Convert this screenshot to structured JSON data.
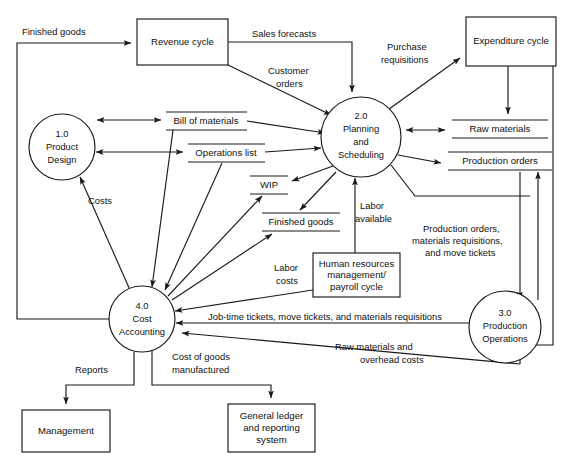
{
  "diagram": {
    "accent_color": "#1a1a1a",
    "background_color": "#ffffff"
  },
  "processes": [
    {
      "id": "p1",
      "number": "1.0",
      "line1": "Product",
      "line2": "Design",
      "cx": 62,
      "cy": 147,
      "r": 33
    },
    {
      "id": "p2",
      "number": "2.0",
      "line1": "Planning",
      "line2": "and",
      "line3": "Scheduling",
      "cx": 361,
      "cy": 137,
      "r": 40
    },
    {
      "id": "p3",
      "number": "3.0",
      "line1": "Production",
      "line2": "Operations",
      "cx": 505,
      "cy": 327,
      "r": 36
    },
    {
      "id": "p4",
      "number": "4.0",
      "line1": "Cost",
      "line2": "Accounting",
      "cx": 142,
      "cy": 319,
      "r": 33
    }
  ],
  "entities": [
    {
      "id": "e-revenue",
      "line1": "Revenue cycle",
      "x": 137,
      "y": 19,
      "w": 91,
      "h": 46
    },
    {
      "id": "e-expenditure",
      "line1": "Expenditure cycle",
      "x": 466,
      "y": 17,
      "w": 90,
      "h": 49
    },
    {
      "id": "e-hr",
      "line1": "Human resources",
      "line2": "management/",
      "line3": "payroll cycle",
      "x": 313,
      "y": 253,
      "w": 87,
      "h": 44
    },
    {
      "id": "e-management",
      "line1": "Management",
      "x": 22,
      "y": 410,
      "w": 88,
      "h": 42
    },
    {
      "id": "e-gl",
      "line1": "General ledger",
      "line2": "and reporting",
      "line3": "system",
      "x": 228,
      "y": 404,
      "w": 87,
      "h": 48
    }
  ],
  "datastores": [
    {
      "id": "ds-bom",
      "label": "Bill of materials",
      "x": 166,
      "y": 112,
      "w": 81,
      "h": 18
    },
    {
      "id": "ds-ops",
      "label": "Operations list",
      "x": 188,
      "y": 144,
      "w": 77,
      "h": 18
    },
    {
      "id": "ds-wip",
      "label": "WIP",
      "x": 250,
      "y": 176,
      "w": 38,
      "h": 18
    },
    {
      "id": "ds-fg",
      "label": "Finished goods",
      "x": 262,
      "y": 213,
      "w": 78,
      "h": 18
    },
    {
      "id": "ds-raw",
      "label": "Raw materials",
      "x": 452,
      "y": 120,
      "w": 96,
      "h": 18
    },
    {
      "id": "ds-prodord",
      "label": "Production orders",
      "x": 448,
      "y": 152,
      "w": 104,
      "h": 18
    }
  ],
  "flows": [
    {
      "id": "f-finished-goods",
      "label": "Finished goods",
      "x": 22,
      "y": 33,
      "anchor": "start"
    },
    {
      "id": "f-sales-forecasts",
      "label": "Sales forecasts",
      "x": 252,
      "y": 35,
      "anchor": "start"
    },
    {
      "id": "f-customer-orders",
      "label": "Customer",
      "label2": "orders",
      "x": 268,
      "y": 72,
      "anchor": "start"
    },
    {
      "id": "f-purchase-req",
      "label": "Purchase",
      "label2": "requisitions",
      "x": 381,
      "y": 48,
      "anchor": "start"
    },
    {
      "id": "f-costs",
      "label": "Costs",
      "x": 88,
      "y": 202,
      "anchor": "start"
    },
    {
      "id": "f-labor-available",
      "label": "Labor",
      "label2": "available",
      "x": 358,
      "y": 207,
      "anchor": "start"
    },
    {
      "id": "f-labor-costs",
      "label": "Labor",
      "label2": "costs",
      "x": 274,
      "y": 269,
      "anchor": "start"
    },
    {
      "id": "f-prod-orders-mat",
      "label": "Production orders,",
      "label2": "materials requisitions,",
      "label3": "and move tickets",
      "x": 425,
      "y": 230,
      "anchor": "start"
    },
    {
      "id": "f-jobtime",
      "label": "Job-time tickets, move tickets, and materials requisitions",
      "x": 208,
      "y": 318,
      "anchor": "start"
    },
    {
      "id": "f-raw-overhead",
      "label": "Raw materials and",
      "label2": "overhead costs",
      "x": 335,
      "y": 350,
      "anchor": "start"
    },
    {
      "id": "f-reports",
      "label": "Reports",
      "x": 75,
      "y": 371,
      "anchor": "start"
    },
    {
      "id": "f-cogm",
      "label": "Cost of goods",
      "label2": "manufactured",
      "x": 172,
      "y": 358,
      "anchor": "start"
    }
  ]
}
